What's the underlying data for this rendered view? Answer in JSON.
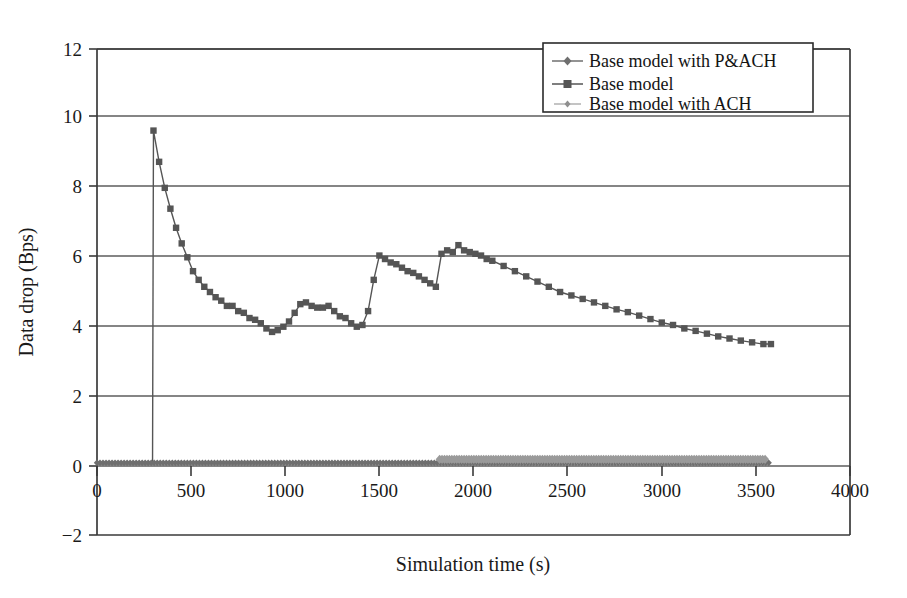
{
  "figure": {
    "background_color": "#ffffff",
    "frame_color": "#3a3a3a"
  },
  "axes": {
    "x_title": "Simulation time (s)",
    "y_title": "Data drop (Bps)",
    "x_ticks": [
      "0",
      "500",
      "1000",
      "1500",
      "2000",
      "2500",
      "3000",
      "3500",
      "4000"
    ],
    "y_ticks": [
      "12",
      "10",
      "8",
      "6",
      "4",
      "2",
      "0",
      "−2"
    ]
  },
  "legend": {
    "position": "top-right",
    "entries": [
      {
        "label": "Base model with P&ACH",
        "marker": "diamond",
        "color": "#6f6f6f"
      },
      {
        "label": "Base model",
        "marker": "square",
        "color": "#555555"
      },
      {
        "label": "Base model with ACH",
        "marker": "dot",
        "color": "#9a9a9a"
      }
    ]
  },
  "chart_data": {
    "type": "line",
    "title": "",
    "xlabel": "Simulation time (s)",
    "ylabel": "Data drop (Bps)",
    "xlim": [
      0,
      4000
    ],
    "ylim": [
      -2,
      12
    ],
    "xticks": [
      0,
      500,
      1000,
      1500,
      2000,
      2500,
      3000,
      3500,
      4000
    ],
    "yticks": [
      -2,
      0,
      2,
      4,
      6,
      8,
      10,
      12
    ],
    "grid": "horizontal",
    "legend_position": "top-right",
    "series": [
      {
        "name": "Base model",
        "marker": "square",
        "color": "#555555",
        "x": [
          0,
          30,
          60,
          90,
          120,
          150,
          180,
          210,
          240,
          270,
          295,
          300,
          330,
          360,
          390,
          420,
          450,
          480,
          510,
          540,
          570,
          600,
          630,
          660,
          690,
          720,
          750,
          780,
          810,
          840,
          870,
          900,
          930,
          960,
          990,
          1020,
          1050,
          1080,
          1110,
          1140,
          1170,
          1200,
          1230,
          1260,
          1290,
          1320,
          1350,
          1380,
          1410,
          1440,
          1470,
          1500,
          1530,
          1560,
          1590,
          1620,
          1650,
          1680,
          1710,
          1740,
          1770,
          1800,
          1830,
          1860,
          1890,
          1920,
          1950,
          1980,
          2010,
          2040,
          2070,
          2100,
          2160,
          2220,
          2280,
          2340,
          2400,
          2460,
          2520,
          2580,
          2640,
          2700,
          2760,
          2820,
          2880,
          2940,
          3000,
          3060,
          3120,
          3180,
          3240,
          3300,
          3360,
          3420,
          3480,
          3540,
          3580
        ],
        "y": [
          0.05,
          0.05,
          0.05,
          0.05,
          0.05,
          0.05,
          0.05,
          0.05,
          0.05,
          0.05,
          0.05,
          9.65,
          8.75,
          8.0,
          7.4,
          6.85,
          6.4,
          6.0,
          5.6,
          5.35,
          5.15,
          5.0,
          4.85,
          4.75,
          4.6,
          4.6,
          4.45,
          4.4,
          4.25,
          4.2,
          4.1,
          3.95,
          3.85,
          3.9,
          4.0,
          4.15,
          4.4,
          4.65,
          4.7,
          4.6,
          4.55,
          4.55,
          4.6,
          4.45,
          4.3,
          4.25,
          4.1,
          4.0,
          4.05,
          4.45,
          5.35,
          6.05,
          5.95,
          5.85,
          5.8,
          5.7,
          5.6,
          5.55,
          5.45,
          5.35,
          5.25,
          5.15,
          6.1,
          6.2,
          6.15,
          6.35,
          6.2,
          6.15,
          6.1,
          6.05,
          5.95,
          5.9,
          5.75,
          5.6,
          5.45,
          5.3,
          5.15,
          5.0,
          4.9,
          4.8,
          4.7,
          4.6,
          4.5,
          4.42,
          4.32,
          4.22,
          4.12,
          4.05,
          3.95,
          3.88,
          3.8,
          3.72,
          3.66,
          3.6,
          3.55,
          3.5,
          3.5
        ]
      },
      {
        "name": "Base model with P&ACH",
        "marker": "diamond",
        "color": "#6f6f6f",
        "x_range": [
          0,
          3580
        ],
        "y_constant": 0.08,
        "note": "near-zero flat series with dense diamond markers spanning full x range"
      },
      {
        "name": "Base model with ACH",
        "marker": "dot",
        "color": "#9a9a9a",
        "x_range": [
          1820,
          3560
        ],
        "y_constant": 0.18,
        "note": "near-zero flat series, denser taller markers from ~1820 to ~3560"
      }
    ]
  }
}
